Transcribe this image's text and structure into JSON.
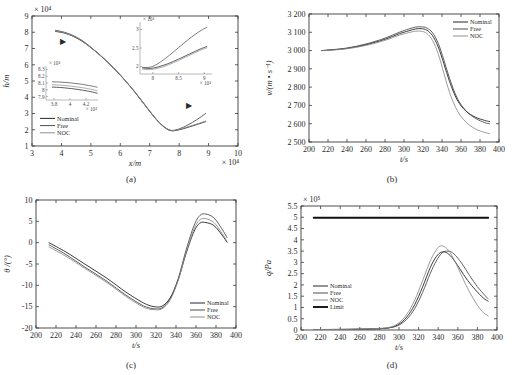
{
  "figure": {
    "caption_partial": "",
    "panel_captions": [
      "(a)",
      "(b)",
      "(c)",
      "(d)"
    ]
  },
  "series_names": {
    "nominal": "Nominal",
    "free": "Free",
    "noc": "NOC",
    "limit": "Limit"
  },
  "colors": {
    "nominal": "#1a1a1a",
    "free": "#444444",
    "noc": "#8a8a8a",
    "limit": "#111111",
    "axis": "#3a3a3a"
  },
  "chart_data": [
    {
      "id": "panel-a",
      "type": "line",
      "title": "",
      "caption": "(a)",
      "xlabel": "x/m",
      "ylabel": "h/m",
      "x_multiplier": "× 10⁴",
      "y_multiplier": "× 10⁴",
      "xlim": [
        3,
        10
      ],
      "ylim": [
        1,
        9
      ],
      "xticks": [
        3,
        4,
        5,
        6,
        7,
        8,
        9,
        10
      ],
      "yticks": [
        1,
        2,
        3,
        4,
        5,
        6,
        7,
        8,
        9
      ],
      "grid": false,
      "legend_position": "lower-left",
      "legend": [
        "Nominal",
        "Free",
        "NOC"
      ],
      "annotations": [
        {
          "name": "arrow-to-left-inset",
          "x": 4.05,
          "y": 7.25,
          "glyph": "▶"
        },
        {
          "name": "arrow-to-right-inset",
          "x": 8.35,
          "y": 3.35,
          "glyph": "▶"
        }
      ],
      "series": [
        {
          "name": "Nominal",
          "x": [
            3.8,
            4.1,
            4.4,
            4.7,
            5.0,
            5.3,
            5.6,
            5.9,
            6.2,
            6.5,
            6.8,
            7.1,
            7.4,
            7.7,
            8.0,
            8.3,
            8.6,
            8.9
          ],
          "y": [
            8.05,
            7.95,
            7.75,
            7.45,
            7.05,
            6.6,
            6.1,
            5.55,
            4.95,
            4.3,
            3.6,
            2.9,
            2.3,
            1.95,
            2.0,
            2.15,
            2.32,
            2.5
          ]
        },
        {
          "name": "Free",
          "x": [
            3.8,
            4.1,
            4.4,
            4.7,
            5.0,
            5.3,
            5.6,
            5.9,
            6.2,
            6.5,
            6.8,
            7.1,
            7.4,
            7.7,
            8.0,
            8.3,
            8.6,
            8.9
          ],
          "y": [
            8.12,
            8.0,
            7.8,
            7.5,
            7.08,
            6.62,
            6.12,
            5.57,
            4.97,
            4.32,
            3.62,
            2.92,
            2.32,
            1.97,
            2.05,
            2.3,
            2.62,
            3.0
          ]
        },
        {
          "name": "NOC",
          "x": [
            3.8,
            4.1,
            4.4,
            4.7,
            5.0,
            5.3,
            5.6,
            5.9,
            6.2,
            6.5,
            6.8,
            7.1,
            7.4,
            7.7,
            8.0,
            8.3,
            8.6,
            8.9
          ],
          "y": [
            8.08,
            7.97,
            7.77,
            7.47,
            7.06,
            6.61,
            6.11,
            5.56,
            4.96,
            4.31,
            3.61,
            2.91,
            2.31,
            1.96,
            2.02,
            2.18,
            2.35,
            2.53
          ]
        }
      ],
      "insets": [
        {
          "id": "inset-a-left",
          "xlim": [
            3.7,
            4.35
          ],
          "ylim": [
            7.85,
            8.35
          ],
          "xticks": [
            3.8,
            4,
            4.2
          ],
          "yticks": [
            7.9,
            8,
            8.1,
            8.2,
            8.3
          ],
          "x_multiplier": "× 10⁴",
          "y_multiplier": "× 10⁴",
          "series": [
            {
              "name": "Nominal",
              "x": [
                3.78,
                3.9,
                4.02,
                4.14,
                4.26,
                4.34
              ],
              "y": [
                8.04,
                8.032,
                8.018,
                7.998,
                7.972,
                7.95
              ]
            },
            {
              "name": "Free",
              "x": [
                3.78,
                3.9,
                4.02,
                4.14,
                4.26,
                4.34
              ],
              "y": [
                8.118,
                8.112,
                8.1,
                8.082,
                8.058,
                8.038
              ]
            },
            {
              "name": "NOC",
              "x": [
                3.78,
                3.9,
                4.02,
                4.14,
                4.26,
                4.34
              ],
              "y": [
                8.074,
                8.066,
                8.053,
                8.034,
                8.008,
                7.986
              ]
            }
          ]
        },
        {
          "id": "inset-a-right",
          "xlim": [
            7.75,
            9.15
          ],
          "ylim": [
            1.8,
            3.2
          ],
          "xticks": [
            8,
            8.5,
            9
          ],
          "yticks": [
            2,
            2.5,
            3
          ],
          "x_multiplier": "× 10⁴",
          "y_multiplier": "× 10⁴",
          "series": [
            {
              "name": "Nominal",
              "x": [
                7.8,
                7.95,
                8.1,
                8.3,
                8.5,
                8.7,
                8.9,
                9.05
              ],
              "y": [
                1.965,
                1.95,
                1.99,
                2.08,
                2.2,
                2.33,
                2.46,
                2.54
              ]
            },
            {
              "name": "Free",
              "x": [
                7.8,
                7.95,
                8.1,
                8.3,
                8.5,
                8.7,
                8.9,
                9.05
              ],
              "y": [
                1.98,
                1.985,
                2.08,
                2.28,
                2.51,
                2.74,
                2.94,
                3.06
              ]
            },
            {
              "name": "NOC",
              "x": [
                7.8,
                7.95,
                8.1,
                8.3,
                8.5,
                8.7,
                8.9,
                9.05
              ],
              "y": [
                1.93,
                1.92,
                1.955,
                2.045,
                2.165,
                2.295,
                2.425,
                2.505
              ]
            }
          ]
        }
      ]
    },
    {
      "id": "panel-b",
      "type": "line",
      "title": "",
      "caption": "(b)",
      "xlabel": "t/s",
      "ylabel": "v/(m • s⁻¹)",
      "xlim": [
        200,
        400
      ],
      "ylim": [
        2500,
        3200
      ],
      "xticks": [
        200,
        220,
        240,
        260,
        280,
        300,
        320,
        340,
        360,
        380,
        400
      ],
      "yticks": [
        2500,
        2600,
        2700,
        2800,
        2900,
        3000,
        3100,
        3200
      ],
      "ytick_labels": [
        "2 500",
        "2 600",
        "2 700",
        "2 800",
        "2 900",
        "3 000",
        "3 100",
        "3 200"
      ],
      "grid": false,
      "legend_position": "upper-right",
      "legend": [
        "Nominal",
        "Free",
        "NOC"
      ],
      "series": [
        {
          "name": "Nominal",
          "x": [
            213,
            220,
            240,
            260,
            280,
            295,
            305,
            312,
            318,
            324,
            330,
            336,
            342,
            348,
            356,
            365,
            375,
            385,
            390
          ],
          "y": [
            3000,
            3002,
            3012,
            3032,
            3062,
            3092,
            3108,
            3118,
            3120,
            3112,
            3082,
            3020,
            2928,
            2830,
            2730,
            2670,
            2636,
            2618,
            2612
          ]
        },
        {
          "name": "Free",
          "x": [
            213,
            220,
            240,
            260,
            280,
            295,
            305,
            312,
            318,
            324,
            330,
            336,
            342,
            348,
            356,
            365,
            375,
            385,
            390
          ],
          "y": [
            3000,
            3003,
            3014,
            3036,
            3068,
            3100,
            3118,
            3128,
            3130,
            3124,
            3098,
            3040,
            2948,
            2848,
            2740,
            2672,
            2630,
            2606,
            2600
          ]
        },
        {
          "name": "NOC",
          "x": [
            213,
            220,
            240,
            260,
            280,
            295,
            305,
            312,
            318,
            324,
            330,
            336,
            342,
            348,
            356,
            365,
            375,
            385,
            390
          ],
          "y": [
            3000,
            3001,
            3010,
            3028,
            3056,
            3084,
            3098,
            3106,
            3106,
            3094,
            3056,
            2982,
            2876,
            2770,
            2672,
            2610,
            2572,
            2552,
            2546
          ]
        }
      ]
    },
    {
      "id": "panel-c",
      "type": "line",
      "title": "",
      "caption": "(c)",
      "xlabel": "t/s",
      "ylabel": "θ /(°)",
      "xlim": [
        200,
        400
      ],
      "ylim": [
        -20,
        10
      ],
      "xticks": [
        200,
        220,
        240,
        260,
        280,
        300,
        320,
        340,
        360,
        380,
        400
      ],
      "yticks": [
        -20,
        -15,
        -10,
        -5,
        0,
        5,
        10
      ],
      "grid": false,
      "legend_position": "lower-right",
      "legend": [
        "Nominal",
        "Free",
        "NOC"
      ],
      "series": [
        {
          "name": "Nominal",
          "x": [
            213,
            230,
            250,
            270,
            290,
            305,
            312,
            318,
            326,
            334,
            342,
            350,
            358,
            364,
            370,
            378,
            386,
            391
          ],
          "y": [
            0.0,
            -2.2,
            -5.2,
            -8.2,
            -11.6,
            -13.8,
            -14.6,
            -15.0,
            -14.9,
            -13.0,
            -8.8,
            -2.6,
            2.6,
            4.6,
            4.7,
            4.0,
            1.8,
            0.1
          ]
        },
        {
          "name": "Free",
          "x": [
            213,
            230,
            250,
            270,
            290,
            305,
            312,
            318,
            326,
            334,
            342,
            350,
            358,
            364,
            370,
            378,
            386,
            391
          ],
          "y": [
            -0.5,
            -2.8,
            -5.9,
            -8.9,
            -12.3,
            -14.5,
            -15.2,
            -15.5,
            -15.3,
            -13.2,
            -8.6,
            -1.8,
            4.0,
            6.4,
            6.7,
            5.8,
            3.2,
            1.2
          ]
        },
        {
          "name": "NOC",
          "x": [
            213,
            230,
            250,
            270,
            290,
            305,
            312,
            318,
            326,
            334,
            342,
            350,
            358,
            364,
            370,
            378,
            386,
            391
          ],
          "y": [
            -1.0,
            -3.2,
            -6.2,
            -9.2,
            -12.6,
            -14.8,
            -15.5,
            -15.7,
            -15.5,
            -13.5,
            -9.0,
            -2.4,
            3.2,
            5.4,
            5.6,
            4.7,
            2.2,
            0.3
          ]
        }
      ]
    },
    {
      "id": "panel-d",
      "type": "line",
      "title": "",
      "caption": "(d)",
      "xlabel": "t/s",
      "ylabel": "q/Pa",
      "y_multiplier": "× 10⁵",
      "xlim": [
        200,
        400
      ],
      "ylim": [
        0,
        5.5
      ],
      "xticks": [
        200,
        220,
        240,
        260,
        280,
        300,
        320,
        340,
        360,
        380,
        400
      ],
      "yticks": [
        0,
        0.5,
        1,
        1.5,
        2,
        2.5,
        3,
        3.5,
        4,
        4.5,
        5,
        5.5
      ],
      "grid": false,
      "legend_position": "lower-left",
      "legend": [
        "Nominal",
        "Free",
        "NOC",
        "Limit"
      ],
      "series": [
        {
          "name": "Nominal",
          "x": [
            213,
            250,
            280,
            292,
            300,
            308,
            316,
            324,
            332,
            338,
            343,
            348,
            354,
            362,
            370,
            378,
            386,
            391
          ],
          "y": [
            0.02,
            0.03,
            0.06,
            0.12,
            0.26,
            0.58,
            1.12,
            1.9,
            2.78,
            3.25,
            3.45,
            3.44,
            3.22,
            2.72,
            2.2,
            1.78,
            1.42,
            1.28
          ]
        },
        {
          "name": "Free",
          "x": [
            213,
            250,
            280,
            292,
            300,
            308,
            316,
            324,
            332,
            338,
            344,
            350,
            356,
            364,
            372,
            380,
            388,
            391
          ],
          "y": [
            0.02,
            0.03,
            0.06,
            0.11,
            0.22,
            0.48,
            0.95,
            1.66,
            2.52,
            3.06,
            3.42,
            3.5,
            3.38,
            2.96,
            2.42,
            1.92,
            1.52,
            1.38
          ]
        },
        {
          "name": "NOC",
          "x": [
            213,
            250,
            280,
            292,
            300,
            308,
            316,
            324,
            332,
            338,
            342,
            346,
            352,
            360,
            368,
            376,
            384,
            391
          ],
          "y": [
            0.02,
            0.03,
            0.07,
            0.14,
            0.32,
            0.7,
            1.32,
            2.18,
            3.08,
            3.55,
            3.72,
            3.7,
            3.44,
            2.78,
            2.02,
            1.38,
            0.86,
            0.62
          ]
        },
        {
          "name": "Limit",
          "x": [
            213,
            391
          ],
          "y": [
            4.98,
            4.98
          ]
        }
      ]
    }
  ]
}
